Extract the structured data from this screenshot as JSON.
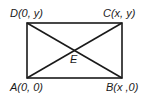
{
  "diagram": {
    "type": "rectangle-with-diagonals",
    "vertices": [
      {
        "name": "A",
        "label": "A(0, 0)",
        "px": [
          27,
          78
        ]
      },
      {
        "name": "B",
        "label": "B(x ,0)",
        "px": [
          122,
          78
        ]
      },
      {
        "name": "C",
        "label": "C(x, y)",
        "px": [
          122,
          23
        ]
      },
      {
        "name": "D",
        "label": "D(0, y)",
        "px": [
          27,
          23
        ]
      }
    ],
    "intersection": {
      "name": "E",
      "label": "E",
      "px": [
        74,
        50
      ]
    },
    "stroke_color": "#1a1a1a"
  }
}
